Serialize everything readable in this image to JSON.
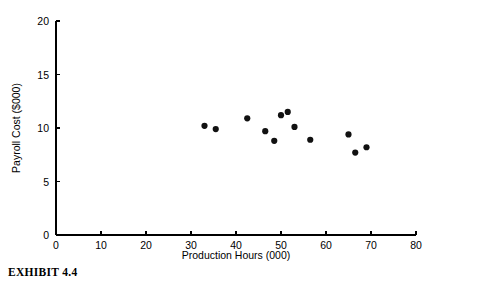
{
  "caption": "EXHIBIT 4.4",
  "chart_data": {
    "type": "scatter",
    "title": "",
    "xlabel": "Production Hours (000)",
    "ylabel": "Payroll Cost ($000)",
    "xlim": [
      0,
      80
    ],
    "ylim": [
      0,
      20
    ],
    "xticks": [
      0,
      10,
      20,
      30,
      40,
      50,
      60,
      70,
      80
    ],
    "xtick_labels": [
      "0",
      "10",
      "20",
      "30",
      "40",
      "50",
      "60",
      "70",
      "80"
    ],
    "yticks": [
      0,
      5,
      10,
      15,
      20
    ],
    "ytick_labels": [
      "0",
      "5",
      "10",
      "15",
      "20"
    ],
    "grid": false,
    "legend": null,
    "marker": "filled-circle",
    "marker_color": "#111111",
    "points": [
      {
        "x": 33.0,
        "y": 10.2
      },
      {
        "x": 35.5,
        "y": 9.9
      },
      {
        "x": 42.5,
        "y": 10.9
      },
      {
        "x": 46.5,
        "y": 9.7
      },
      {
        "x": 50.0,
        "y": 11.2
      },
      {
        "x": 51.5,
        "y": 11.5
      },
      {
        "x": 53.0,
        "y": 10.1
      },
      {
        "x": 56.5,
        "y": 8.9
      },
      {
        "x": 65.0,
        "y": 9.4
      },
      {
        "x": 66.5,
        "y": 7.7
      },
      {
        "x": 69.0,
        "y": 8.2
      },
      {
        "x": 48.5,
        "y": 8.8
      }
    ]
  }
}
